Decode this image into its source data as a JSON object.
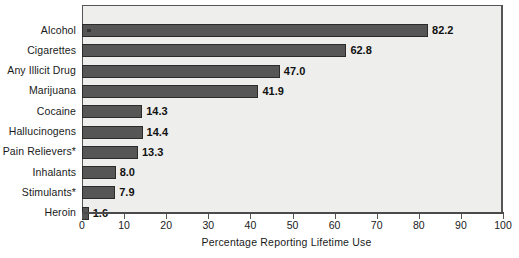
{
  "chart_data": {
    "type": "bar",
    "orientation": "horizontal",
    "title": "",
    "xlabel": "Percentage Reporting Lifetime Use",
    "ylabel": "",
    "xlim": [
      0,
      100
    ],
    "xticks": [
      0,
      10,
      20,
      30,
      40,
      50,
      60,
      70,
      80,
      90,
      100
    ],
    "grid": false,
    "legend": null,
    "categories": [
      "Alcohol",
      "Cigarettes",
      "Any Illicit Drug",
      "Marijuana",
      "Cocaine",
      "Hallucinogens",
      "Pain Relievers*",
      "Inhalants",
      "Stimulants*",
      "Heroin"
    ],
    "values": [
      82.2,
      62.8,
      47.0,
      41.9,
      14.3,
      14.4,
      13.3,
      8.0,
      7.9,
      1.6
    ],
    "value_labels": [
      "82.2",
      "62.8",
      "47.0",
      "41.9",
      "14.3",
      "14.4",
      "13.3",
      "8.0",
      "7.9",
      "1.6"
    ],
    "tick_labels": [
      "0",
      "10",
      "20",
      "30",
      "40",
      "50",
      "60",
      "70",
      "80",
      "90",
      "100"
    ],
    "colors": {
      "bar_fill": "#565656",
      "bar_border": "#2b2b2b",
      "plot_background": "#eeeeec",
      "frame": "#555555",
      "text": "#1a1a1a",
      "value_text": "#111111"
    },
    "footnote_marker": "*"
  }
}
